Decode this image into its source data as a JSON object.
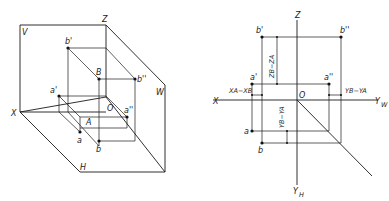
{
  "figure": {
    "colors": {
      "line": "#1a1a1a",
      "background": "#ffffff"
    }
  },
  "left_view": {
    "planes": {
      "V": "V",
      "W": "W",
      "H": "H"
    },
    "axes": {
      "X": "X",
      "Z": "Z",
      "origin": "O"
    },
    "points": {
      "A": "A",
      "B": "B",
      "a": "a",
      "b": "b",
      "a_prime": "a'",
      "b_prime": "b'",
      "a_dprime": "a''",
      "b_dprime": "b''"
    }
  },
  "right_view": {
    "axes": {
      "X": "X",
      "Z": "Z",
      "origin": "O",
      "YW": "Y",
      "YW_sub": "W",
      "YH": "Y",
      "YH_sub": "H"
    },
    "points": {
      "a": "a",
      "b": "b",
      "a_prime": "a'",
      "b_prime": "b'",
      "a_dprime": "a''",
      "b_dprime": "b''"
    },
    "dimensions": {
      "zdiff": "Zʙ−Zᴀ",
      "zdiff_text": "ZB−ZA",
      "xdiff_text": "XA−XB",
      "ydiff_w_text": "YB−YA",
      "ydiff_h_text": "YB−YA"
    }
  }
}
